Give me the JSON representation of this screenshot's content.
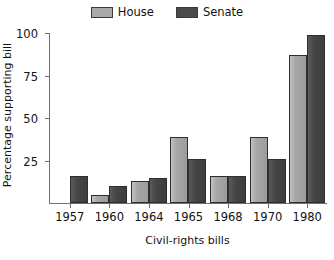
{
  "chart_data": {
    "type": "bar",
    "title": "",
    "subtitle": "",
    "xlabel": "Civil-rights bills",
    "ylabel": "Percentage supporting bill",
    "categories": [
      "1957",
      "1960",
      "1964",
      "1965",
      "1968",
      "1970",
      "1980"
    ],
    "series": [
      {
        "name": "House",
        "color": "#a9a9a9",
        "values": [
          0,
          5,
          13,
          39,
          16,
          39,
          87
        ]
      },
      {
        "name": "Senate",
        "color": "#4a4a4a",
        "values": [
          16,
          10,
          15,
          26,
          16,
          26,
          99
        ]
      }
    ],
    "ylim": [
      0,
      100
    ],
    "yticks": [
      "25",
      "50",
      "75",
      "100"
    ],
    "ytick_values": [
      25,
      50,
      75,
      100
    ],
    "grid": false,
    "legend_position": "top-center",
    "orientation": "vertical",
    "bar_grouping": "grouped"
  },
  "legend": {
    "entries": [
      {
        "label": "House",
        "swatch": "house-swatch"
      },
      {
        "label": "Senate",
        "swatch": "senate-swatch"
      }
    ]
  },
  "axes": {
    "y": {
      "title": "Percentage supporting bill",
      "ticks": [
        "25",
        "50",
        "75",
        "100"
      ]
    },
    "x": {
      "title": "Civil-rights bills",
      "ticks": [
        "1957",
        "1960",
        "1964",
        "1965",
        "1968",
        "1970",
        "1980"
      ]
    }
  }
}
